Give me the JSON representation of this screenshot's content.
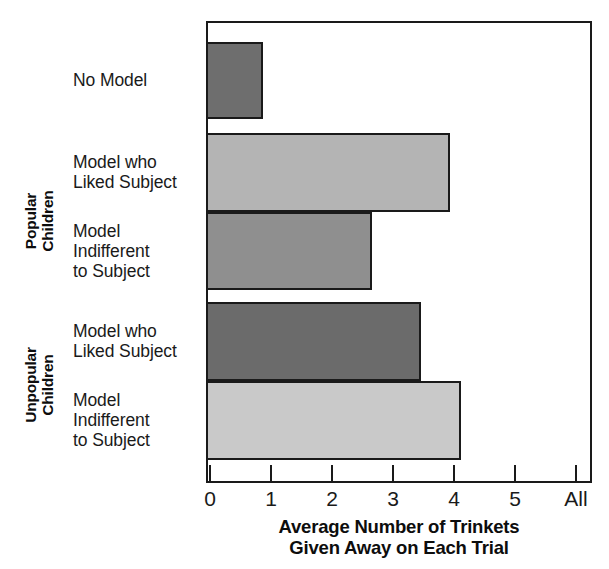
{
  "chart_data": {
    "type": "bar",
    "orientation": "horizontal",
    "title": "",
    "xlabel": "Average Number of Trinkets\nGiven Away on Each Trial",
    "ylabel": "",
    "xlim": [
      0,
      6
    ],
    "xticks": [
      0,
      1,
      2,
      3,
      4,
      5,
      6
    ],
    "xtick_labels": [
      "0",
      "1",
      "2",
      "3",
      "4",
      "5",
      "All"
    ],
    "grid": false,
    "legend": "none",
    "categories": [
      "No Model",
      "Model who\nLiked Subject",
      "Model\nIndifferent\nto Subject",
      "Model who\nLiked Subject",
      "Model\nIndifferent\nto Subject"
    ],
    "values": [
      0.88,
      3.95,
      2.68,
      3.47,
      4.13
    ],
    "bar_colors": [
      "#6e6e6e",
      "#b4b4b4",
      "#8f8f8f",
      "#6b6b6b",
      "#c9c9c9"
    ],
    "groups": [
      {
        "label": "Popular\nChildren",
        "category_indices": [
          0,
          1,
          2
        ]
      },
      {
        "label": "Unpopular\nChildren",
        "category_indices": [
          3,
          4
        ]
      }
    ]
  },
  "chart": {
    "axis_title": "Average Number of Trinkets\nGiven Away on Each Trial",
    "frame_color": "#1a1a1a",
    "background": "#ffffff",
    "bars": [
      {
        "name": "no-model",
        "label": "No Model",
        "value": 0.88,
        "value_text": "0.88",
        "color": "#6e6e6e"
      },
      {
        "name": "popular-model-liked",
        "label": "Model who\nLiked Subject",
        "value": 3.95,
        "value_text": "3.95",
        "color": "#b4b4b4"
      },
      {
        "name": "popular-model-indifferent",
        "label": "Model\nIndifferent\nto Subject",
        "value": 2.68,
        "value_text": "2.68",
        "color": "#8f8f8f"
      },
      {
        "name": "unpopular-model-liked",
        "label": "Model who\nLiked Subject",
        "value": 3.47,
        "value_text": "3.47",
        "color": "#6b6b6b"
      },
      {
        "name": "unpopular-model-indifferent",
        "label": "Model\nIndifferent\nto Subject",
        "value": 4.13,
        "value_text": "4.13",
        "color": "#c9c9c9"
      }
    ],
    "group_labels": [
      {
        "name": "popular-children",
        "text": "Popular\nChildren"
      },
      {
        "name": "unpopular-children",
        "text": "Unpopular\nChildren"
      }
    ],
    "x_axis": {
      "ticks": [
        "0",
        "1",
        "2",
        "3",
        "4",
        "5",
        "All"
      ]
    }
  }
}
